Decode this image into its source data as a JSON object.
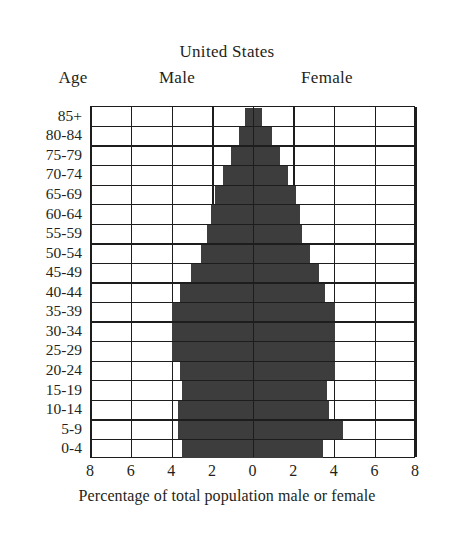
{
  "chart_data": {
    "type": "bar",
    "subtype": "population-pyramid",
    "title": "United States",
    "xlabel": "Percentage of total population male or female",
    "ylabel": "Age",
    "left_header": "Male",
    "right_header": "Female",
    "grid": true,
    "legend": "none",
    "xlim": [
      -8,
      8
    ],
    "xticks": [
      8,
      6,
      4,
      2,
      0,
      2,
      4,
      6,
      8
    ],
    "xtick_values": [
      -8,
      -6,
      -4,
      -2,
      0,
      2,
      4,
      6,
      8
    ],
    "categories": [
      "0-4",
      "5-9",
      "10-14",
      "15-19",
      "20-24",
      "25-29",
      "30-34",
      "35-39",
      "40-44",
      "45-49",
      "50-54",
      "55-59",
      "60-64",
      "65-69",
      "70-74",
      "75-79",
      "80-84",
      "85+"
    ],
    "series": [
      {
        "name": "Male",
        "values": [
          3.5,
          3.7,
          3.7,
          3.5,
          3.6,
          4.0,
          4.0,
          4.0,
          3.6,
          3.1,
          2.6,
          2.3,
          2.1,
          1.9,
          1.5,
          1.1,
          0.7,
          0.4
        ]
      },
      {
        "name": "Female",
        "values": [
          3.4,
          4.4,
          3.7,
          3.6,
          4.0,
          4.0,
          4.0,
          4.0,
          3.5,
          3.2,
          2.8,
          2.4,
          2.3,
          2.1,
          1.7,
          1.3,
          0.9,
          0.4
        ]
      }
    ],
    "bar_color": "#3d3d3d",
    "grid_color": "#1d1d1d",
    "background": "#ffffff"
  }
}
